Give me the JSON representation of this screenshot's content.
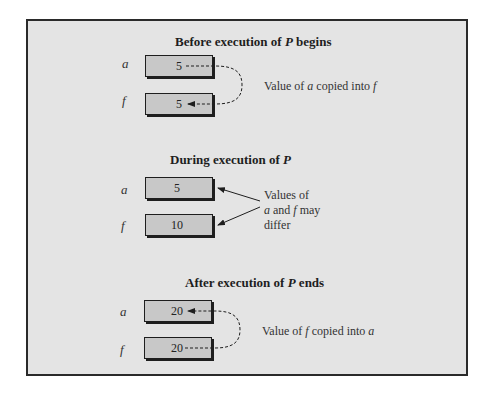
{
  "sections": [
    {
      "title_pre": "Before execution of ",
      "title_proc": "P",
      "title_post": " begins",
      "var_a": "a",
      "var_f": "f",
      "a_value": "5",
      "f_value": "5",
      "note_pre": "Value of ",
      "note_var1": "a",
      "note_mid": " copied into ",
      "note_var2": "f"
    },
    {
      "title_pre": "During execution of ",
      "title_proc": "P",
      "title_post": "",
      "var_a": "a",
      "var_f": "f",
      "a_value": "5",
      "f_value": "10",
      "note_line1": "Values of",
      "note_var1": "a",
      "note_mid": " and ",
      "note_var2": "f",
      "note_line2_post": " may",
      "note_line3": "differ"
    },
    {
      "title_pre": "After execution of ",
      "title_proc": "P",
      "title_post": " ends",
      "var_a": "a",
      "var_f": "f",
      "a_value": "20",
      "f_value": "20",
      "note_pre": "Value of ",
      "note_var1": "f",
      "note_mid": " copied into ",
      "note_var2": "a"
    }
  ],
  "colors": {
    "frame_bg": "#e4e4e4",
    "box_fill": "#c8c8c8",
    "ink": "#1e1e1e"
  }
}
